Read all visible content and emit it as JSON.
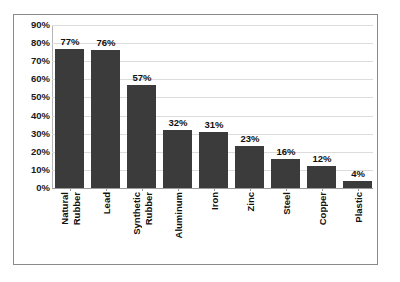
{
  "chart_data": {
    "type": "bar",
    "title": "",
    "subtitle": "",
    "xlabel": "",
    "ylabel": "",
    "categories": [
      "Natural Rubber",
      "Lead",
      "Synthetic Rubber",
      "Aluminum",
      "Iron",
      "Zinc",
      "Steel",
      "Copper",
      "Plastic"
    ],
    "category_lines": [
      [
        "Natural",
        "Rubber"
      ],
      [
        "Lead"
      ],
      [
        "Synthetic",
        "Rubber"
      ],
      [
        "Aluminum"
      ],
      [
        "Iron"
      ],
      [
        "Zinc"
      ],
      [
        "Steel"
      ],
      [
        "Copper"
      ],
      [
        "Plastic"
      ]
    ],
    "values": [
      77,
      76,
      57,
      32,
      31,
      23,
      16,
      12,
      4
    ],
    "value_labels": [
      "77%",
      "76%",
      "57%",
      "32%",
      "31%",
      "23%",
      "16%",
      "12%",
      "4%"
    ],
    "ylim": [
      0,
      90
    ],
    "ytick_values": [
      90,
      80,
      70,
      60,
      50,
      40,
      30,
      20,
      10,
      0
    ],
    "ytick_labels": [
      "90%",
      "80%",
      "70%",
      "60%",
      "50%",
      "40%",
      "30%",
      "20%",
      "10%",
      "0%"
    ],
    "grid": true,
    "legend": false,
    "legend_position": "none",
    "colors": {
      "bar": "#3b3b3b",
      "gridline": "#dcdcdc",
      "axis": "#9a9a9a",
      "frame": "#8a8a8a",
      "text": "#111111",
      "background": "#ffffff"
    }
  }
}
